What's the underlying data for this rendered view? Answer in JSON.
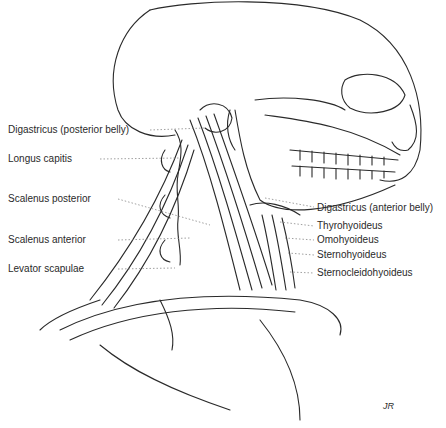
{
  "figure": {
    "signature": "JR",
    "left_labels": [
      {
        "text": "Digastricus (posterior belly)",
        "x": 8,
        "y": 124
      },
      {
        "text": "Longus capitis",
        "x": 8,
        "y": 153
      },
      {
        "text": "Scalenus posterior",
        "x": 8,
        "y": 193
      },
      {
        "text": "Scalenus anterior",
        "x": 8,
        "y": 234
      },
      {
        "text": "Levator scapulae",
        "x": 8,
        "y": 263
      }
    ],
    "right_labels": [
      {
        "text": "Digastricus (anterior belly)",
        "x": 317,
        "y": 202
      },
      {
        "text": "Thyrohyoideus",
        "x": 317,
        "y": 220
      },
      {
        "text": "Omohyoideus",
        "x": 317,
        "y": 234
      },
      {
        "text": "Sternohyoideus",
        "x": 317,
        "y": 249
      },
      {
        "text": "Sternocleidohyoideus",
        "x": 317,
        "y": 267
      }
    ]
  },
  "colors": {
    "ink": "#2a2a2a",
    "paper": "#ffffff",
    "leader": "#888888"
  }
}
